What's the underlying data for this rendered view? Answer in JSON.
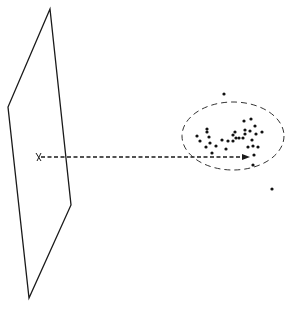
{
  "diagram": {
    "colors": {
      "stroke": "#1a1a1a",
      "dot": "#111111",
      "background": "#ffffff"
    },
    "plane": {
      "points": [
        [
          50,
          9
        ],
        [
          8,
          107
        ],
        [
          29,
          298
        ],
        [
          71,
          205
        ]
      ]
    },
    "origin_marker": {
      "x": 39,
      "y": 157,
      "glyph": "x"
    },
    "arrow": {
      "x1": 41,
      "y1": 157,
      "x2": 250,
      "y2": 157,
      "style": "dashed"
    },
    "cluster_ellipse": {
      "cx": 233,
      "cy": 136,
      "rx": 51,
      "ry": 34,
      "style": "dashed"
    },
    "cluster_points": [
      [
        197,
        136
      ],
      [
        200,
        141
      ],
      [
        207,
        129
      ],
      [
        207,
        132
      ],
      [
        209,
        137
      ],
      [
        210,
        143
      ],
      [
        206,
        147
      ],
      [
        222,
        140
      ],
      [
        212,
        153
      ],
      [
        216,
        146
      ],
      [
        226,
        149
      ],
      [
        228,
        141
      ],
      [
        233,
        141
      ],
      [
        233,
        135
      ],
      [
        236,
        138
      ],
      [
        235,
        132
      ],
      [
        239,
        138
      ],
      [
        243,
        138
      ],
      [
        244,
        121
      ],
      [
        245,
        130
      ],
      [
        245,
        134
      ],
      [
        251,
        119
      ],
      [
        255,
        126
      ],
      [
        250,
        131
      ],
      [
        252,
        140
      ],
      [
        256,
        134
      ],
      [
        253,
        146
      ],
      [
        254,
        155
      ],
      [
        258,
        147
      ],
      [
        262,
        132
      ],
      [
        248,
        147
      ]
    ],
    "outlier_points": [
      [
        224,
        94
      ],
      [
        272,
        189
      ],
      [
        253,
        165
      ]
    ]
  },
  "caption": {
    "text": "",
    "clipped": true
  }
}
